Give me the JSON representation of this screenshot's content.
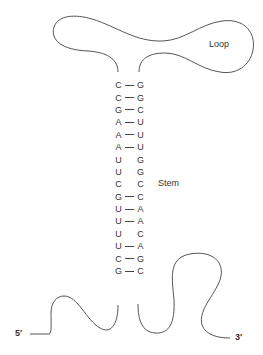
{
  "diagram": {
    "labels": {
      "loop": "Loop",
      "stem": "Stem",
      "five_prime": "5′",
      "three_prime": "3′"
    },
    "stem_pairs": [
      {
        "left": "C",
        "right": "G",
        "bonded": true
      },
      {
        "left": "C",
        "right": "G",
        "bonded": true
      },
      {
        "left": "G",
        "right": "C",
        "bonded": true
      },
      {
        "left": "A",
        "right": "U",
        "bonded": true
      },
      {
        "left": "A",
        "right": "U",
        "bonded": true
      },
      {
        "left": "A",
        "right": "U",
        "bonded": true
      },
      {
        "left": "U",
        "right": "G",
        "bonded": false
      },
      {
        "left": "U",
        "right": "G",
        "bonded": false
      },
      {
        "left": "C",
        "right": "C",
        "bonded": false
      },
      {
        "left": "G",
        "right": "C",
        "bonded": true
      },
      {
        "left": "U",
        "right": "A",
        "bonded": true
      },
      {
        "left": "U",
        "right": "A",
        "bonded": true
      },
      {
        "left": "U",
        "right": "C",
        "bonded": false
      },
      {
        "left": "U",
        "right": "A",
        "bonded": true
      },
      {
        "left": "C",
        "right": "G",
        "bonded": true
      },
      {
        "left": "G",
        "right": "C",
        "bonded": true
      }
    ],
    "colors": {
      "line": "#555555",
      "text": "#333333",
      "background": "#ffffff"
    }
  }
}
